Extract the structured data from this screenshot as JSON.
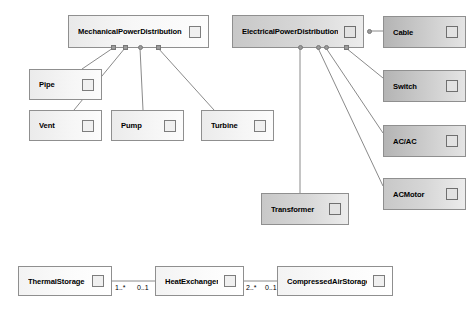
{
  "diagram": {
    "type": "uml-class-diagram",
    "background_color": "#ffffff",
    "border_color": "#8f8f8f",
    "line_color": "#8a8a8a"
  },
  "nodes": [
    {
      "id": "mechanical-power-distribution",
      "label": "MechanicalPowerDistribution",
      "x": 68,
      "y": 15,
      "w": 141,
      "h": 33,
      "shade": "shade-light",
      "font_size": 7.6
    },
    {
      "id": "electrical-power-distribution",
      "label": "ElectricalPowerDistribution",
      "x": 232,
      "y": 15,
      "w": 132,
      "h": 33,
      "shade": "shade-mid",
      "font_size": 7.6
    },
    {
      "id": "cable",
      "label": "Cable",
      "x": 383,
      "y": 16,
      "w": 83,
      "h": 32,
      "shade": "shade-dark",
      "font_size": 7.6
    },
    {
      "id": "switch",
      "label": "Switch",
      "x": 383,
      "y": 70,
      "w": 83,
      "h": 32,
      "shade": "shade-dark",
      "font_size": 7.6
    },
    {
      "id": "ac-ac",
      "label": "AC/AC",
      "x": 383,
      "y": 125,
      "w": 83,
      "h": 32,
      "shade": "shade-dark",
      "font_size": 7.6
    },
    {
      "id": "ac-motor",
      "label": "ACMotor",
      "x": 383,
      "y": 178,
      "w": 83,
      "h": 32,
      "shade": "shade-mid",
      "font_size": 7.6
    },
    {
      "id": "pipe",
      "label": "Pipe",
      "x": 29,
      "y": 69,
      "w": 73,
      "h": 31,
      "shade": "shade-lightflat",
      "font_size": 7.6
    },
    {
      "id": "vent",
      "label": "Vent",
      "x": 29,
      "y": 110,
      "w": 73,
      "h": 31,
      "shade": "shade-lightflat",
      "font_size": 7.6
    },
    {
      "id": "pump",
      "label": "Pump",
      "x": 111,
      "y": 110,
      "w": 73,
      "h": 31,
      "shade": "shade-lightflat",
      "font_size": 7.6
    },
    {
      "id": "turbine",
      "label": "Turbine",
      "x": 201,
      "y": 110,
      "w": 73,
      "h": 31,
      "shade": "shade-lightflat",
      "font_size": 7.6
    },
    {
      "id": "transformer",
      "label": "Transformer",
      "x": 261,
      "y": 193,
      "w": 88,
      "h": 32,
      "shade": "shade-mid",
      "font_size": 7.6
    },
    {
      "id": "thermal-storage",
      "label": "ThermalStorage",
      "x": 18,
      "y": 266,
      "w": 94,
      "h": 30,
      "shade": "shade-white",
      "font_size": 7.6
    },
    {
      "id": "heat-exchanger",
      "label": "HeatExchanger",
      "x": 155,
      "y": 266,
      "w": 89,
      "h": 30,
      "shade": "shade-white",
      "font_size": 7.6
    },
    {
      "id": "compressed-air-storage",
      "label": "CompressedAirStorage",
      "x": 277,
      "y": 266,
      "w": 116,
      "h": 30,
      "shade": "shade-white",
      "font_size": 7.6
    }
  ],
  "anchors": [
    {
      "id": "anchor-mech-1",
      "x": 111,
      "y": 45,
      "shape": "square"
    },
    {
      "id": "anchor-mech-2",
      "x": 123,
      "y": 45,
      "shape": "square"
    },
    {
      "id": "anchor-mech-3",
      "x": 138,
      "y": 45,
      "shape": "round"
    },
    {
      "id": "anchor-mech-4",
      "x": 156,
      "y": 45,
      "shape": "square"
    },
    {
      "id": "anchor-elec-1",
      "x": 298,
      "y": 45,
      "shape": "round"
    },
    {
      "id": "anchor-elec-2",
      "x": 316,
      "y": 45,
      "shape": "round"
    },
    {
      "id": "anchor-elec-3",
      "x": 324,
      "y": 45,
      "shape": "round"
    },
    {
      "id": "anchor-elec-4",
      "x": 344,
      "y": 45,
      "shape": "square"
    },
    {
      "id": "anchor-elec-right",
      "x": 367,
      "y": 29,
      "shape": "round"
    }
  ],
  "edges": [
    {
      "id": "edge-mech-pipe",
      "x1": 113,
      "y1": 48,
      "x2": 82,
      "y2": 69
    },
    {
      "id": "edge-mech-vent",
      "x1": 125,
      "y1": 48,
      "x2": 74,
      "y2": 110
    },
    {
      "id": "edge-mech-pump",
      "x1": 140,
      "y1": 48,
      "x2": 143,
      "y2": 110
    },
    {
      "id": "edge-mech-turbine",
      "x1": 158,
      "y1": 48,
      "x2": 214,
      "y2": 110
    },
    {
      "id": "edge-elec-transformer",
      "x1": 300,
      "y1": 48,
      "x2": 300,
      "y2": 193
    },
    {
      "id": "edge-elec-acmotor",
      "x1": 318,
      "y1": 48,
      "x2": 383,
      "y2": 186
    },
    {
      "id": "edge-elec-acac",
      "x1": 326,
      "y1": 48,
      "x2": 383,
      "y2": 133
    },
    {
      "id": "edge-elec-switch",
      "x1": 346,
      "y1": 48,
      "x2": 383,
      "y2": 78
    },
    {
      "id": "edge-elec-cable",
      "x1": 369,
      "y1": 31,
      "x2": 383,
      "y2": 31
    },
    {
      "id": "edge-thermal-heat",
      "x1": 112,
      "y1": 281,
      "x2": 155,
      "y2": 281
    },
    {
      "id": "edge-heat-compressed",
      "x1": 244,
      "y1": 281,
      "x2": 277,
      "y2": 281
    }
  ],
  "multiplicities": [
    {
      "id": "mult-thermal-end",
      "text": "1..*",
      "x": 115,
      "y": 284
    },
    {
      "id": "mult-heat-left-end",
      "text": "0..1",
      "x": 137,
      "y": 284
    },
    {
      "id": "mult-heat-right-end",
      "text": "2..*",
      "x": 246,
      "y": 284
    },
    {
      "id": "mult-compressed-end",
      "text": "0..1",
      "x": 265,
      "y": 284
    }
  ]
}
